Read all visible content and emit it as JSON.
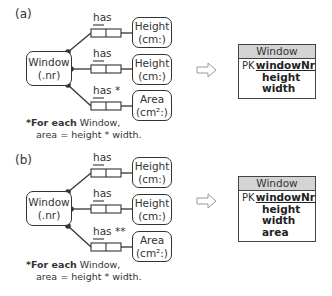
{
  "panels": [
    {
      "label": "(a)",
      "object": {
        "name": "Window",
        "ref": "(.nr)"
      },
      "facts": [
        {
          "role": "has",
          "target_name": "Height",
          "target_unit": "(cm:)"
        },
        {
          "role": "has",
          "target_name": "Height",
          "target_unit": "(cm:)"
        },
        {
          "role": "has *",
          "target_name": "Area",
          "target_unit": "(cm²:)"
        }
      ],
      "footnote": {
        "bold": "*For each",
        "line1_rest": " Window,",
        "line2": "area = height * width."
      },
      "table": {
        "title": "Window",
        "rows": [
          {
            "key": "PK",
            "attr": "windowNr"
          },
          {
            "key": "",
            "attr": "height"
          },
          {
            "key": "",
            "attr": "width"
          }
        ]
      }
    },
    {
      "label": "(b)",
      "object": {
        "name": "Window",
        "ref": "(.nr)"
      },
      "facts": [
        {
          "role": "has",
          "target_name": "Height",
          "target_unit": "(cm:)"
        },
        {
          "role": "has",
          "target_name": "Height",
          "target_unit": "(cm:)"
        },
        {
          "role": "has **",
          "target_name": "Area",
          "target_unit": "(cm²:)"
        }
      ],
      "footnote": {
        "bold": "*For each",
        "line1_rest": " Window,",
        "line2": "area = height * width."
      },
      "table": {
        "title": "Window",
        "rows": [
          {
            "key": "PK",
            "attr": "windowNr"
          },
          {
            "key": "",
            "attr": "height"
          },
          {
            "key": "",
            "attr": "width"
          },
          {
            "key": "",
            "attr": "area"
          }
        ]
      }
    }
  ],
  "arrow_icon": "hollow-right-arrow",
  "colors": {
    "line": "#333333",
    "table_header": "#d4d4d4",
    "arrow": "#999999"
  }
}
